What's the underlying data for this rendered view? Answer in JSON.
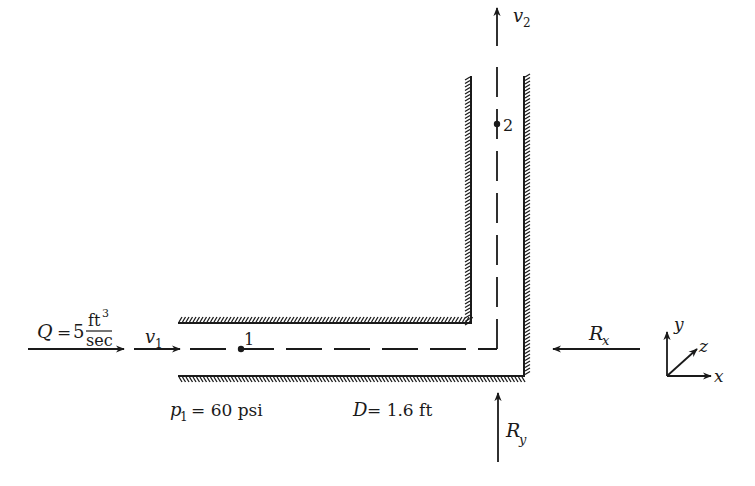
{
  "diagram": {
    "type": "pipe-bend-free-body",
    "inlet_flow": {
      "label_lhs": "Q",
      "equals": "=",
      "value": "5",
      "unit_numerator": "ft",
      "unit_numerator_exp": "3",
      "unit_denominator": "sec"
    },
    "velocity_in": {
      "symbol": "v",
      "subscript": "1"
    },
    "velocity_out": {
      "symbol": "v",
      "subscript": "2"
    },
    "point_1": {
      "label": "1"
    },
    "point_2": {
      "label": "2"
    },
    "pressure": {
      "symbol": "p",
      "subscript": "1",
      "text": "= 60 psi"
    },
    "diameter": {
      "symbol": "D",
      "text": "= 1.6 ft"
    },
    "reaction_x": {
      "symbol": "R",
      "subscript": "x"
    },
    "reaction_y": {
      "symbol": "R",
      "subscript": "y"
    },
    "axes": {
      "x": "x",
      "y": "y",
      "z": "z"
    },
    "colors": {
      "ink": "#1a1a1a",
      "background": "#ffffff"
    }
  }
}
